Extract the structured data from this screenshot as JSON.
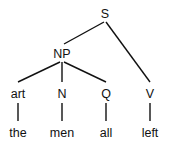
{
  "tree": {
    "nodes": {
      "S": "S",
      "NP": "NP",
      "art": "art",
      "N": "N",
      "Q": "Q",
      "V": "V",
      "the": "the",
      "men": "men",
      "all": "all",
      "left": "left"
    },
    "edges": [
      [
        "S",
        "NP"
      ],
      [
        "S",
        "V"
      ],
      [
        "NP",
        "art"
      ],
      [
        "NP",
        "N"
      ],
      [
        "NP",
        "Q"
      ],
      [
        "art",
        "the"
      ],
      [
        "N",
        "men"
      ],
      [
        "Q",
        "all"
      ],
      [
        "V",
        "left"
      ]
    ]
  }
}
